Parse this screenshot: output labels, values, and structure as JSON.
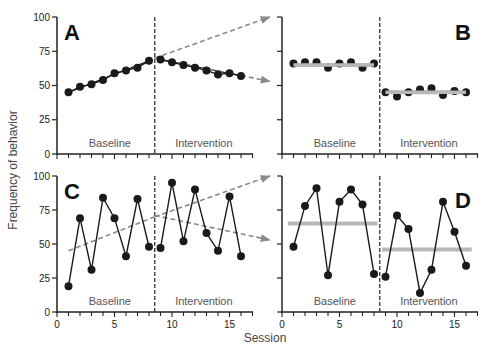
{
  "figure": {
    "ylabel": "Frequency of behavior",
    "xlabel": "Session",
    "phase_labels": [
      "Baseline",
      "Intervention"
    ],
    "colors": {
      "axis": "#222222",
      "data": "#1a1a1a",
      "mean_line": "#b8b8b8",
      "trend_arrow": "#8a8a8a",
      "phase_divider": "#333333"
    }
  },
  "chart_data": [
    {
      "panel": "A",
      "type": "line",
      "title": "A",
      "xlabel": "Session",
      "ylabel": "Frequency of behavior",
      "x": [
        1,
        2,
        3,
        4,
        5,
        6,
        7,
        8,
        9,
        10,
        11,
        12,
        13,
        14,
        15,
        16
      ],
      "series": [
        {
          "name": "Baseline",
          "x": [
            1,
            2,
            3,
            4,
            5,
            6,
            7,
            8
          ],
          "values": [
            45,
            49,
            51,
            54,
            59,
            61,
            63,
            68
          ]
        },
        {
          "name": "Intervention",
          "x": [
            9,
            10,
            11,
            12,
            13,
            14,
            15,
            16
          ],
          "values": [
            69,
            67,
            65,
            63,
            61,
            58,
            59,
            57
          ]
        }
      ],
      "trend_lines": [
        {
          "name": "Baseline trend",
          "from": [
            1,
            45
          ],
          "to": [
            8,
            68
          ]
        },
        {
          "name": "Intervention trend",
          "from": [
            9,
            69
          ],
          "to": [
            16,
            57
          ]
        },
        {
          "name": "Projected baseline trend (dashed arrow)",
          "from": [
            8.5,
            70
          ],
          "to": [
            18.5,
            100
          ]
        },
        {
          "name": "Projected intervention trend (dashed arrow)",
          "from": [
            8.5,
            70
          ],
          "to": [
            18.5,
            53
          ]
        }
      ],
      "phase_change_x": 8.5,
      "phase_labels": [
        "Baseline",
        "Intervention"
      ],
      "xlim": [
        0,
        17
      ],
      "ylim": [
        0,
        100
      ],
      "yticks": [
        0,
        25,
        50,
        75,
        100
      ],
      "ytick_labels_shown": true,
      "xtick_labels_shown": false,
      "grid": false
    },
    {
      "panel": "B",
      "type": "line",
      "title": "B",
      "xlabel": "Session",
      "ylabel": "Frequency of behavior",
      "series": [
        {
          "name": "Baseline",
          "x": [
            1,
            2,
            3,
            4,
            5,
            6,
            7,
            8
          ],
          "values": [
            66,
            67,
            67,
            63,
            66,
            67,
            63,
            66
          ]
        },
        {
          "name": "Intervention",
          "x": [
            9,
            10,
            11,
            12,
            13,
            14,
            15,
            16
          ],
          "values": [
            45,
            42,
            45,
            47,
            48,
            43,
            46,
            45
          ]
        }
      ],
      "mean_lines": [
        {
          "phase": "Baseline",
          "value": 65,
          "from_x": 1,
          "to_x": 8
        },
        {
          "phase": "Intervention",
          "value": 45,
          "from_x": 9,
          "to_x": 16
        }
      ],
      "connect_points": false,
      "phase_change_x": 8.5,
      "phase_labels": [
        "Baseline",
        "Intervention"
      ],
      "xlim": [
        0,
        17
      ],
      "ylim": [
        0,
        100
      ],
      "yticks": [
        0,
        25,
        50,
        75,
        100
      ],
      "ytick_labels_shown": false,
      "xtick_labels_shown": false,
      "grid": false
    },
    {
      "panel": "C",
      "type": "line",
      "title": "C",
      "xlabel": "Session",
      "ylabel": "Frequency of behavior",
      "series": [
        {
          "name": "Baseline",
          "x": [
            1,
            2,
            3,
            4,
            5,
            6,
            7,
            8
          ],
          "values": [
            19,
            69,
            31,
            84,
            69,
            41,
            83,
            48
          ]
        },
        {
          "name": "Intervention",
          "x": [
            9,
            10,
            11,
            12,
            13,
            14,
            15,
            16
          ],
          "values": [
            47,
            95,
            52,
            90,
            58,
            45,
            85,
            41
          ]
        }
      ],
      "trend_lines": [
        {
          "name": "Baseline trend (dashed)",
          "from": [
            1,
            45
          ],
          "to": [
            8.5,
            70
          ]
        },
        {
          "name": "Projected baseline trend (dashed arrow)",
          "from": [
            8.5,
            70
          ],
          "to": [
            18.5,
            100
          ]
        },
        {
          "name": "Intervention trend (dashed arrow)",
          "from": [
            8.5,
            71
          ],
          "to": [
            18.5,
            53
          ]
        }
      ],
      "phase_change_x": 8.5,
      "phase_labels": [
        "Baseline",
        "Intervention"
      ],
      "xlim": [
        0,
        17
      ],
      "ylim": [
        0,
        100
      ],
      "xticks": [
        0,
        5,
        10,
        15
      ],
      "yticks": [
        0,
        25,
        50,
        75,
        100
      ],
      "ytick_labels_shown": true,
      "xtick_labels_shown": true,
      "grid": false
    },
    {
      "panel": "D",
      "type": "line",
      "title": "D",
      "xlabel": "Session",
      "ylabel": "Frequency of behavior",
      "series": [
        {
          "name": "Baseline",
          "x": [
            1,
            2,
            3,
            4,
            5,
            6,
            7,
            8
          ],
          "values": [
            48,
            78,
            91,
            27,
            81,
            90,
            79,
            28
          ]
        },
        {
          "name": "Intervention",
          "x": [
            9,
            10,
            11,
            12,
            13,
            14,
            15,
            16
          ],
          "values": [
            26,
            71,
            61,
            14,
            31,
            81,
            59,
            34
          ]
        }
      ],
      "mean_lines": [
        {
          "phase": "Baseline",
          "value": 65,
          "from_x": 0.5,
          "to_x": 8.3
        },
        {
          "phase": "Intervention",
          "value": 46,
          "from_x": 8.7,
          "to_x": 16.5
        }
      ],
      "phase_change_x": 8.5,
      "phase_labels": [
        "Baseline",
        "Intervention"
      ],
      "xlim": [
        0,
        17
      ],
      "ylim": [
        0,
        100
      ],
      "xticks": [
        0,
        5,
        10,
        15
      ],
      "yticks": [
        0,
        25,
        50,
        75,
        100
      ],
      "ytick_labels_shown": false,
      "xtick_labels_shown": true,
      "grid": false
    }
  ]
}
